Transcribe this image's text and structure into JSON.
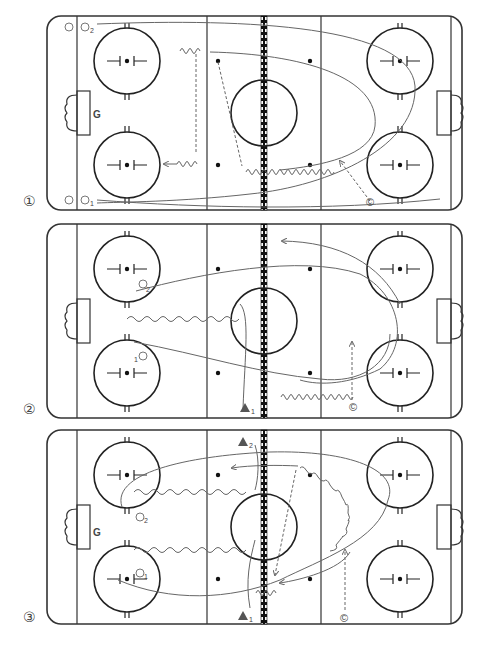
{
  "diagrams": [
    {
      "number": "①",
      "goalie_label": "G",
      "players": [
        {
          "symbol": "○",
          "label": "O",
          "sub": "2"
        },
        {
          "symbol": "○",
          "label": "O",
          "sub": "1"
        }
      ],
      "coach_label": "©"
    },
    {
      "number": "②",
      "players": [
        {
          "label": "O",
          "sub": "2"
        },
        {
          "label": "O",
          "sub": "1"
        }
      ],
      "defender_sub": "1",
      "coach_label": "©"
    },
    {
      "number": "③",
      "goalie_label": "G",
      "players": [
        {
          "label": "O",
          "sub": "2"
        },
        {
          "label": "O",
          "sub": "1"
        }
      ],
      "defenders": [
        {
          "sub": "2"
        },
        {
          "sub": "1"
        }
      ],
      "coach_label": "©"
    }
  ],
  "colors": {
    "rink_line": "#333333",
    "path": "#666666",
    "background": "#ffffff"
  }
}
